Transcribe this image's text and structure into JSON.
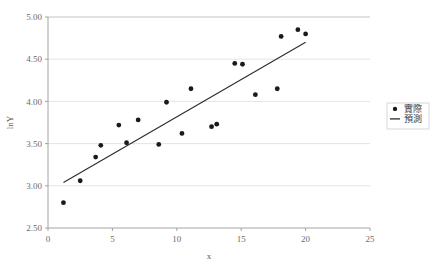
{
  "chart_data": {
    "type": "scatter",
    "title": "",
    "xlabel": "x",
    "ylabel": "lnY",
    "xlim": [
      0,
      25
    ],
    "ylim": [
      2.5,
      5.0
    ],
    "xticks": [
      "0",
      "5",
      "10",
      "15",
      "20",
      "25"
    ],
    "xtick_values": [
      0,
      5,
      10,
      15,
      20,
      25
    ],
    "yticks": [
      "2.50",
      "3.00",
      "3.50",
      "4.00",
      "4.50",
      "5.00"
    ],
    "ytick_values": [
      2.5,
      3.0,
      3.5,
      4.0,
      4.5,
      5.0
    ],
    "grid": "horizontal",
    "legend_position": "right",
    "legend": [
      {
        "label": "實際",
        "marker": "circle",
        "color": "#1a1a1a"
      },
      {
        "label": "預測",
        "marker": "line",
        "color": "#2b2b2b"
      }
    ],
    "series": [
      {
        "name": "實際",
        "type": "scatter",
        "marker": "circle",
        "color": "#1a1a1a",
        "points": [
          [
            1.2,
            2.8
          ],
          [
            2.5,
            3.06
          ],
          [
            3.7,
            3.34
          ],
          [
            4.1,
            3.48
          ],
          [
            5.5,
            3.72
          ],
          [
            6.1,
            3.51
          ],
          [
            7.0,
            3.78
          ],
          [
            8.6,
            3.49
          ],
          [
            9.2,
            3.99
          ],
          [
            10.4,
            3.62
          ],
          [
            11.1,
            4.15
          ],
          [
            12.7,
            3.7
          ],
          [
            13.1,
            3.73
          ],
          [
            14.5,
            4.45
          ],
          [
            15.1,
            4.44
          ],
          [
            16.1,
            4.08
          ],
          [
            17.8,
            4.15
          ],
          [
            18.1,
            4.77
          ],
          [
            19.4,
            4.85
          ],
          [
            20.0,
            4.8
          ]
        ]
      },
      {
        "name": "預測",
        "type": "line",
        "color": "#2b2b2b",
        "points": [
          [
            1.2,
            3.04
          ],
          [
            20.0,
            4.7
          ]
        ]
      }
    ]
  }
}
